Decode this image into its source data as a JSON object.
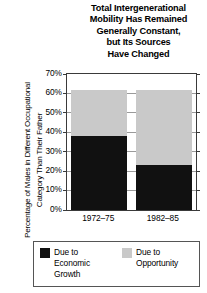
{
  "chart_data": {
    "type": "bar",
    "subtype": "stacked-column",
    "title": "Total Intergenerational\nMobility Has Remained\nGenerally Constant,\nbut Its Sources\nHave Changed",
    "xlabel": "",
    "ylabel": "Percentage of Males in Different Occupational\nCategory Than Their Father",
    "categories": [
      "1972–75",
      "1982–85"
    ],
    "series": [
      {
        "name": "Due to\nEconomic\nGrowth",
        "color": "#111111",
        "values": [
          38,
          23
        ]
      },
      {
        "name": "Due to\nOpportunity",
        "color": "#c9c9c9",
        "values": [
          24,
          39
        ]
      }
    ],
    "totals": [
      62,
      62
    ],
    "ylim": [
      0,
      70
    ],
    "yticks": [
      0,
      10,
      20,
      30,
      40,
      50,
      60,
      70
    ],
    "ytick_labels": [
      "0%",
      "10%",
      "20%",
      "30%",
      "40%",
      "50%",
      "60%",
      "70%"
    ],
    "grid": true,
    "legend_position": "bottom"
  },
  "legend": {
    "entries": [
      {
        "label": "Due to\nEconomic\nGrowth",
        "color": "#111111"
      },
      {
        "label": "Due to\nOpportunity",
        "color": "#c9c9c9"
      }
    ]
  }
}
